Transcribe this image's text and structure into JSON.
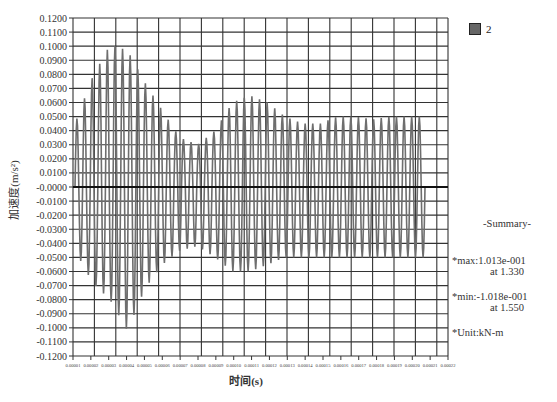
{
  "chart_data": {
    "type": "line",
    "title": "",
    "xlabel": "时间(s)",
    "ylabel": "加速度(m/s²)",
    "ylim": [
      -0.12,
      0.12
    ],
    "y_ticks": [
      "0.1200",
      "0.1100",
      "0.1000",
      "0.0900",
      "0.0800",
      "0.0700",
      "0.0600",
      "0.0500",
      "0.0400",
      "0.0300",
      "0.0200",
      "0.0100",
      "-0.0000",
      "-0.0100",
      "-0.0200",
      "-0.0300",
      "-0.0400",
      "-0.0500",
      "-0.0600",
      "-0.0700",
      "-0.0800",
      "-0.0900",
      "-0.1000",
      "-0.1100",
      "-0.1200"
    ],
    "x_ticks": [
      "0.00001",
      "0.00002",
      "0.00003",
      "0.00004",
      "0.00005",
      "0.00006",
      "0.00007",
      "0.00008",
      "0.00009",
      "0.00010",
      "0.00011",
      "0.00012",
      "0.00013",
      "0.00014",
      "0.00015",
      "0.00016",
      "0.00017",
      "0.00018",
      "0.00019",
      "0.00020",
      "0.00021",
      "0.00022"
    ],
    "grid": true,
    "legend_position": "right",
    "series": [
      {
        "name": "2",
        "color": "#6e6e6e",
        "envelope_peaks": [
          0.045,
          0.078,
          0.101,
          0.097,
          0.074,
          0.054,
          0.035,
          0.03,
          0.04,
          0.06,
          0.065,
          0.06,
          0.05,
          0.045,
          0.045,
          0.05,
          0.05,
          0.048,
          0.05,
          0.05,
          0.05
        ],
        "envelope_troughs": [
          -0.045,
          -0.068,
          -0.08,
          -0.102,
          -0.072,
          -0.055,
          -0.045,
          -0.042,
          -0.05,
          -0.06,
          -0.06,
          -0.055,
          -0.05,
          -0.05,
          -0.05,
          -0.05,
          -0.05,
          -0.05,
          -0.05,
          -0.05,
          -0.05
        ]
      }
    ]
  },
  "legend": {
    "items": [
      {
        "label": "2",
        "color": "#666666"
      }
    ]
  },
  "summary": {
    "title": "-Summary-",
    "max_label": "*max:1.013e-001",
    "max_at": "at 1.330",
    "min_label": "*min:-1.018e-001",
    "min_at": "at 1.550",
    "unit_label": "*Unit:kN-m"
  }
}
